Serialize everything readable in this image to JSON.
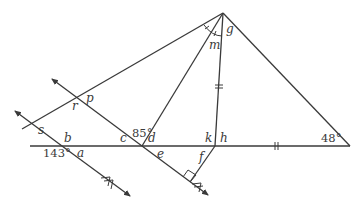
{
  "diagram": {
    "type": "geometry",
    "colors": {
      "stroke": "#3a3a3a",
      "background": "#ffffff"
    },
    "vertices": {
      "apex": "g",
      "base_right_angle": "48°",
      "given_angle_at_c_d": "85°",
      "given_angle_at_b": "143°"
    },
    "labels": {
      "g": "g",
      "m": "m",
      "p": "p",
      "r": "r",
      "s": "s",
      "b": "b",
      "a": "a",
      "c": "c",
      "d": "d",
      "e": "e",
      "k": "k",
      "h": "h",
      "f": "f",
      "angle_85": "85°",
      "angle_143": "143°",
      "angle_48": "48°"
    },
    "marks": {
      "equal_segments": [
        "double tick on segment from g to h",
        "double tick on base from h to right vertex"
      ],
      "angle_bisector_ticks": "single ticks on both halves of angle at g (left of m)",
      "right_angle": "at foot of segment f on lower parallel line",
      "parallel_arrows": "double chevrons on both arrowed parallel lines"
    }
  }
}
